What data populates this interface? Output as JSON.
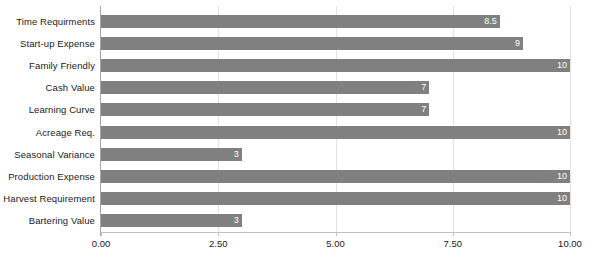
{
  "chart_data": {
    "type": "bar",
    "orientation": "horizontal",
    "title": "",
    "subtitle": "",
    "xlabel": "",
    "ylabel": "",
    "xlim": [
      0,
      10
    ],
    "grid": true,
    "legend": false,
    "bar_color": "#808080",
    "value_label_color": "#ffffff",
    "categories": [
      "Time Requirments",
      "Start-up Expense",
      "Family Friendly",
      "Cash Value",
      "Learning Curve",
      "Acreage Req.",
      "Seasonal Variance",
      "Production Expense",
      "Harvest Requirement",
      "Bartering Value"
    ],
    "values": [
      8.5,
      9,
      10,
      7,
      7,
      10,
      3,
      10,
      10,
      3
    ],
    "value_labels": [
      "8.5",
      "9",
      "10",
      "7",
      "7",
      "10",
      "3",
      "10",
      "10",
      "3"
    ],
    "xticks": [
      0,
      2.5,
      5,
      7.5,
      10
    ],
    "xticklabels": [
      "0.00",
      "2.50",
      "5.00",
      "7.50",
      "10.00"
    ]
  }
}
